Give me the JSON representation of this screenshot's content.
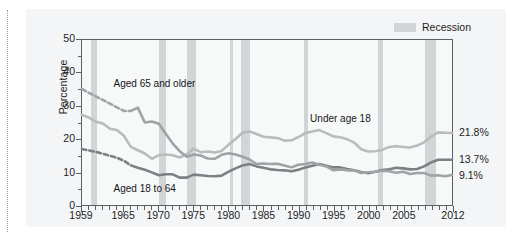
{
  "chart_data": {
    "type": "line",
    "title": "",
    "xlabel": "",
    "ylabel": "Percentage",
    "xlim": [
      1959,
      2012
    ],
    "ylim": [
      0,
      50
    ],
    "ytick_labels": [
      "0",
      "10",
      "20",
      "30",
      "40",
      "50"
    ],
    "ytick_values": [
      0,
      10,
      20,
      30,
      40,
      50
    ],
    "xtick_labels": [
      "1959",
      "1965",
      "1970",
      "1975",
      "1980",
      "1985",
      "1990",
      "1995",
      "2000",
      "2005",
      "2012"
    ],
    "xtick_values": [
      1959,
      1965,
      1970,
      1975,
      1980,
      1985,
      1990,
      1995,
      2000,
      2005,
      2012
    ],
    "grid": false,
    "legend_position": "top-right",
    "legend": [
      {
        "label": "Recession",
        "color": "#d2d5d7",
        "type": "band"
      }
    ],
    "annotations": [
      {
        "text": "Aged 65 and older",
        "x": 1963.5,
        "y": 36.5
      },
      {
        "text": "Under age 18",
        "x": 1991.5,
        "y": 26.0
      },
      {
        "text": "Aged 18 to 64",
        "x": 1963.5,
        "y": 5.2
      }
    ],
    "endpoint_labels": [
      {
        "series": "Under age 18",
        "value": "21.8%"
      },
      {
        "series": "Aged 18 to 64",
        "value": "13.7%"
      },
      {
        "series": "Aged 65 and older",
        "value": "9.1%"
      }
    ],
    "recession_bands": [
      {
        "start": 1960.3,
        "end": 1961.2
      },
      {
        "start": 1969.9,
        "end": 1970.9
      },
      {
        "start": 1973.9,
        "end": 1975.2
      },
      {
        "start": 1980.1,
        "end": 1980.5
      },
      {
        "start": 1981.6,
        "end": 1982.9
      },
      {
        "start": 1990.6,
        "end": 1991.2
      },
      {
        "start": 2001.2,
        "end": 2001.9
      },
      {
        "start": 2007.9,
        "end": 2009.5
      }
    ],
    "series": [
      {
        "name": "Under age 18",
        "color": "#b9bbbd",
        "x": [
          1959,
          1960,
          1961,
          1962,
          1963,
          1964,
          1965,
          1966,
          1967,
          1968,
          1969,
          1970,
          1971,
          1972,
          1973,
          1974,
          1975,
          1976,
          1977,
          1978,
          1979,
          1980,
          1981,
          1982,
          1983,
          1984,
          1985,
          1986,
          1987,
          1988,
          1989,
          1990,
          1991,
          1992,
          1993,
          1994,
          1995,
          1996,
          1997,
          1998,
          1999,
          2000,
          2001,
          2002,
          2003,
          2004,
          2005,
          2006,
          2007,
          2008,
          2009,
          2010,
          2011,
          2012
        ],
        "values": [
          27.3,
          26.5,
          25.2,
          24.7,
          23.1,
          22.7,
          21.0,
          17.6,
          16.6,
          15.6,
          14.0,
          15.1,
          15.3,
          15.1,
          14.4,
          15.4,
          17.1,
          16.0,
          16.2,
          15.9,
          16.4,
          18.3,
          20.0,
          21.9,
          22.3,
          21.5,
          20.7,
          20.5,
          20.3,
          19.5,
          19.6,
          20.6,
          21.8,
          22.3,
          22.7,
          21.8,
          20.8,
          20.5,
          19.9,
          18.9,
          16.9,
          16.2,
          16.3,
          16.7,
          17.6,
          17.8,
          17.6,
          17.4,
          18.0,
          19.0,
          20.7,
          22.0,
          21.9,
          21.8
        ]
      },
      {
        "name": "Aged 18 to 64",
        "color": "#7b8084",
        "x": [
          1959,
          1960,
          1961,
          1962,
          1963,
          1964,
          1965,
          1966,
          1967,
          1968,
          1969,
          1970,
          1971,
          1972,
          1973,
          1974,
          1975,
          1976,
          1977,
          1978,
          1979,
          1980,
          1981,
          1982,
          1983,
          1984,
          1985,
          1986,
          1987,
          1988,
          1989,
          1990,
          1991,
          1992,
          1993,
          1994,
          1995,
          1996,
          1997,
          1998,
          1999,
          2000,
          2001,
          2002,
          2003,
          2004,
          2005,
          2006,
          2007,
          2008,
          2009,
          2010,
          2011,
          2012
        ],
        "values": [
          17.0,
          16.5,
          16.1,
          15.5,
          14.9,
          14.3,
          13.4,
          12.0,
          11.3,
          10.7,
          9.9,
          9.0,
          9.3,
          9.3,
          8.3,
          8.3,
          9.2,
          9.0,
          8.8,
          8.7,
          8.9,
          10.1,
          11.1,
          12.0,
          12.4,
          11.7,
          11.3,
          10.8,
          10.6,
          10.5,
          10.2,
          10.7,
          11.4,
          11.9,
          12.4,
          11.9,
          11.4,
          11.4,
          10.9,
          10.5,
          10.0,
          9.6,
          10.1,
          10.6,
          10.8,
          11.3,
          11.1,
          10.8,
          10.9,
          11.7,
          12.9,
          13.7,
          13.7,
          13.7
        ]
      },
      {
        "name": "Aged 65 and older",
        "color": "#9fa3a6",
        "x": [
          1959,
          1960,
          1961,
          1962,
          1963,
          1964,
          1965,
          1966,
          1967,
          1968,
          1969,
          1970,
          1971,
          1972,
          1973,
          1974,
          1975,
          1976,
          1977,
          1978,
          1979,
          1980,
          1981,
          1982,
          1983,
          1984,
          1985,
          1986,
          1987,
          1988,
          1989,
          1990,
          1991,
          1992,
          1993,
          1994,
          1995,
          1996,
          1997,
          1998,
          1999,
          2000,
          2001,
          2002,
          2003,
          2004,
          2005,
          2006,
          2007,
          2008,
          2009,
          2010,
          2011,
          2012
        ],
        "values": [
          35.2,
          34.0,
          32.9,
          31.8,
          30.7,
          29.6,
          28.5,
          28.5,
          29.5,
          25.0,
          25.3,
          24.6,
          21.6,
          18.6,
          16.3,
          14.6,
          15.3,
          15.0,
          14.1,
          14.0,
          15.2,
          15.7,
          15.3,
          14.6,
          13.8,
          12.4,
          12.6,
          12.4,
          12.5,
          12.0,
          11.4,
          12.2,
          12.4,
          12.9,
          12.2,
          11.7,
          10.5,
          10.8,
          10.5,
          10.5,
          9.7,
          9.9,
          10.1,
          10.4,
          10.2,
          9.8,
          10.1,
          9.4,
          9.7,
          9.7,
          8.9,
          9.0,
          8.7,
          9.1
        ]
      }
    ]
  },
  "legend": {
    "recession_label": "Recession"
  },
  "axis": {
    "y_title": "Percentage"
  }
}
